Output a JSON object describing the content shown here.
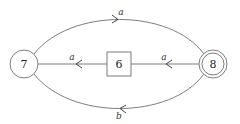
{
  "diagram": {
    "type": "automaton",
    "nodes": [
      {
        "id": "7",
        "label": "7",
        "shape": "circle",
        "x": 24,
        "y": 64
      },
      {
        "id": "6",
        "label": "6",
        "shape": "square",
        "x": 119,
        "y": 64
      },
      {
        "id": "8",
        "label": "8",
        "shape": "double-circle",
        "x": 213,
        "y": 64
      }
    ],
    "edges": [
      {
        "from": "7",
        "to": "8",
        "label": "a",
        "route": "top-arc"
      },
      {
        "from": "6",
        "to": "7",
        "label": "a",
        "route": "straight"
      },
      {
        "from": "8",
        "to": "6",
        "label": "a",
        "route": "straight"
      },
      {
        "from": "8",
        "to": "7",
        "label": "b",
        "route": "bottom-arc"
      }
    ]
  }
}
